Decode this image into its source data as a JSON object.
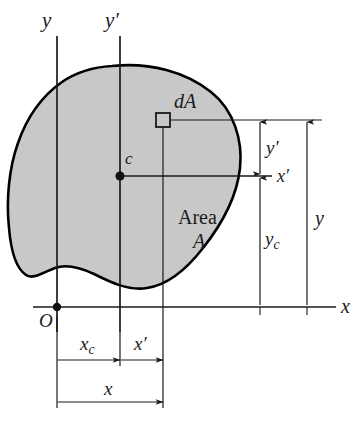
{
  "figure": {
    "type": "engineering-diagram",
    "background_color": "#ffffff",
    "area_fill_color": "#c8c8c8",
    "outline_color": "#000000",
    "line_color": "#1a1a1a"
  },
  "labels": {
    "axis_y": "y",
    "axis_y_prime": "y′",
    "axis_x": "x",
    "axis_x_prime": "x′",
    "origin": "O",
    "centroid": "c",
    "element": "dA",
    "area_word": "Area",
    "area_symbol": "A"
  },
  "dimensions": {
    "y_prime": {
      "label": "y′",
      "base": "y",
      "subscript": "",
      "prime": true
    },
    "y_c": {
      "label": "y_c",
      "base": "y",
      "subscript": "c",
      "prime": false
    },
    "y_total": {
      "label": "y",
      "base": "y",
      "subscript": "",
      "prime": false
    },
    "x_c": {
      "label": "x_c",
      "base": "x",
      "subscript": "c",
      "prime": false
    },
    "x_prime": {
      "label": "x′",
      "base": "x",
      "subscript": "",
      "prime": true
    },
    "x_total": {
      "label": "x",
      "base": "x",
      "subscript": "",
      "prime": false
    }
  },
  "geometry": {
    "origin_point": {
      "x": 57,
      "y": 307
    },
    "centroid_point": {
      "x": 120,
      "y": 176
    },
    "element_square": {
      "x": 156,
      "y": 112,
      "size": 14
    },
    "axis_y_x": 57,
    "axis_y_prime_x": 120,
    "element_line_x": 163,
    "axis_x_y": 307,
    "axis_x_prime_y": 176,
    "element_line_y": 120
  }
}
